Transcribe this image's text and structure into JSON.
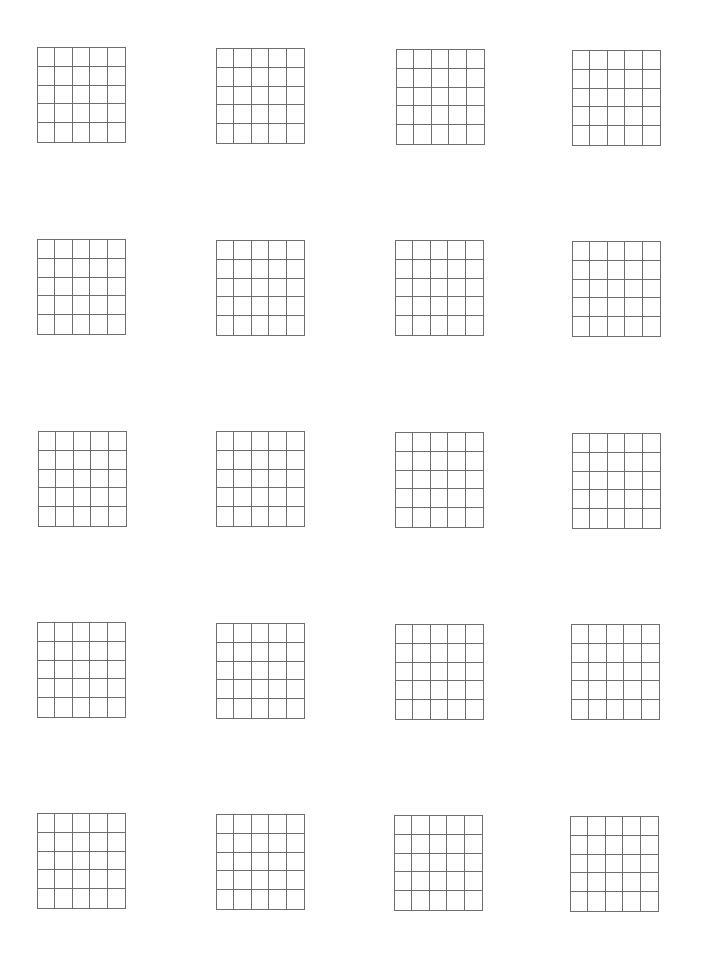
{
  "worksheet": {
    "layout": {
      "rows": 5,
      "columns": 4,
      "cells_per_grid": {
        "rows": 5,
        "columns": 5
      },
      "line_color": "#6e6e6e",
      "background": "#ffffff"
    },
    "grids": [
      {
        "row": 0,
        "col": 0,
        "x": 37,
        "y": 47
      },
      {
        "row": 0,
        "col": 1,
        "x": 216,
        "y": 48
      },
      {
        "row": 0,
        "col": 2,
        "x": 396,
        "y": 49
      },
      {
        "row": 0,
        "col": 3,
        "x": 572,
        "y": 50
      },
      {
        "row": 1,
        "col": 0,
        "x": 37,
        "y": 239
      },
      {
        "row": 1,
        "col": 1,
        "x": 216,
        "y": 240
      },
      {
        "row": 1,
        "col": 2,
        "x": 395,
        "y": 240
      },
      {
        "row": 1,
        "col": 3,
        "x": 572,
        "y": 241
      },
      {
        "row": 2,
        "col": 0,
        "x": 38,
        "y": 431
      },
      {
        "row": 2,
        "col": 1,
        "x": 216,
        "y": 431
      },
      {
        "row": 2,
        "col": 2,
        "x": 395,
        "y": 432
      },
      {
        "row": 2,
        "col": 3,
        "x": 572,
        "y": 433
      },
      {
        "row": 3,
        "col": 0,
        "x": 37,
        "y": 622
      },
      {
        "row": 3,
        "col": 1,
        "x": 216,
        "y": 623
      },
      {
        "row": 3,
        "col": 2,
        "x": 395,
        "y": 624
      },
      {
        "row": 3,
        "col": 3,
        "x": 571,
        "y": 624
      },
      {
        "row": 4,
        "col": 0,
        "x": 37,
        "y": 813
      },
      {
        "row": 4,
        "col": 1,
        "x": 216,
        "y": 814
      },
      {
        "row": 4,
        "col": 2,
        "x": 394,
        "y": 815
      },
      {
        "row": 4,
        "col": 3,
        "x": 570,
        "y": 816
      }
    ]
  }
}
